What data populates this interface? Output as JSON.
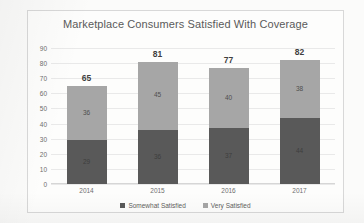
{
  "chart_data": {
    "type": "bar",
    "subtype": "stacked-column",
    "title": "Marketplace Consumers Satisfied With Coverage",
    "xlabel": "",
    "ylabel": "",
    "categories": [
      "2014",
      "2015",
      "2016",
      "2017"
    ],
    "series": [
      {
        "name": "Somewhat Satisfied",
        "color": "#595959",
        "values": [
          29,
          36,
          37,
          44
        ]
      },
      {
        "name": "Very Satisfied",
        "color": "#a6a6a6",
        "values": [
          36,
          45,
          40,
          38
        ]
      }
    ],
    "totals": [
      65,
      81,
      77,
      82
    ],
    "ylim": [
      0,
      90
    ],
    "ytick_step": 10,
    "yticks": [
      "90",
      "80",
      "70",
      "60",
      "50",
      "40",
      "30",
      "20",
      "10",
      "0"
    ],
    "grid": true,
    "data_labels": true,
    "legend_position": "bottom"
  },
  "colors": {
    "somewhat_satisfied": "#595959",
    "very_satisfied": "#a6a6a6",
    "gridline": "#e9e9e9",
    "frame_border": "#d8d8d8",
    "text": "#5a5a5a",
    "background": "#fdfdfc"
  }
}
